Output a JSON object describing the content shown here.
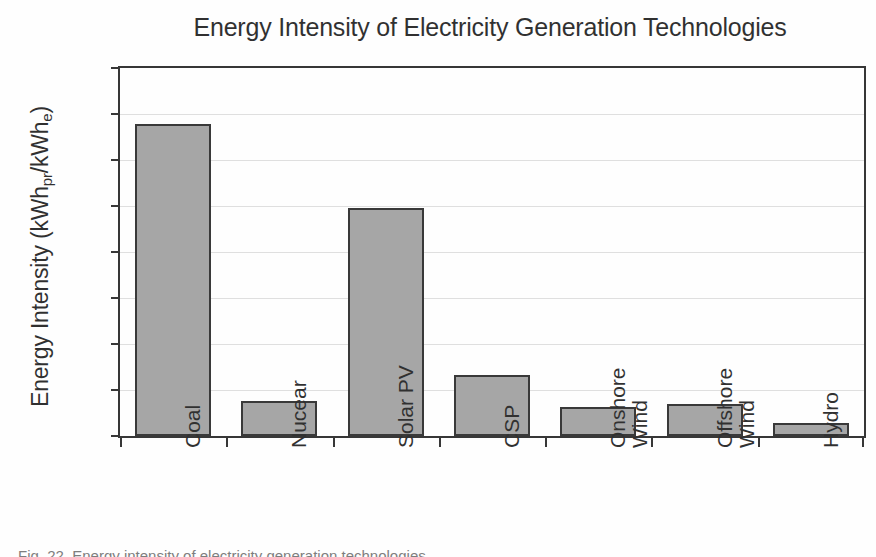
{
  "chart_data": {
    "type": "bar",
    "title": "Energy Intensity of Electricity Generation Technologies",
    "xlabel": "",
    "ylabel": "Energy Intensity (kWhpr/kWhe)",
    "ylabel_parts": {
      "prefix": "Energy Intensity (kWh",
      "sub1": "pr",
      "middle": "/kWh",
      "sub2": "e",
      "suffix": ")"
    },
    "categories": [
      "Coal",
      "Nucear",
      "Solar PV",
      "CSP",
      "Onshore Wind",
      "Offshore Wind",
      "Hydro"
    ],
    "values": [
      0.339,
      0.038,
      0.248,
      0.066,
      0.032,
      0.035,
      0.014
    ],
    "ylim": [
      0.0,
      0.4
    ],
    "ytick_step": 0.05,
    "ytick_labels": [
      "0.40",
      "0.35",
      "0.30",
      "0.25",
      "0.20",
      "0.15",
      "0.10",
      "0.05",
      "0.00"
    ],
    "ytick_values": [
      0.4,
      0.35,
      0.3,
      0.25,
      0.2,
      0.15,
      0.1,
      0.05,
      0.0
    ],
    "grid": true,
    "legend": false,
    "bar_fill_color": "#9b9b9b",
    "bar_border_color": "#1f1f1f",
    "axis_color": "#1d1d1d",
    "gridline_color": "#dcdcdc",
    "text_color": "#151515"
  },
  "caption": {
    "text": "Fig. 22. Energy intensity of electricity generation technologies"
  }
}
